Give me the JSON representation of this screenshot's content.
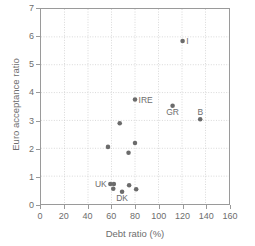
{
  "chart_data": {
    "type": "scatter",
    "title": "",
    "xlabel": "Debt ratio (%)",
    "ylabel": "Euro acceptance ratio",
    "xlim": [
      0,
      160
    ],
    "ylim": [
      0,
      7
    ],
    "xticks": [
      0,
      20,
      40,
      60,
      80,
      100,
      120,
      140,
      160
    ],
    "yticks": [
      0,
      1,
      2,
      3,
      4,
      5,
      6,
      7
    ],
    "grid": true,
    "legend": "none",
    "marker_color": "#6b6b6b",
    "axis_color": "#9a9a9a",
    "text_color": "#6d6d6d",
    "points": [
      {
        "label": "I",
        "x": 120.5,
        "y": 5.85,
        "label_pos": "right"
      },
      {
        "label": "IRE",
        "x": 80.0,
        "y": 3.75,
        "label_pos": "right"
      },
      {
        "label": "GR",
        "x": 112.0,
        "y": 3.53,
        "label_pos": "below"
      },
      {
        "label": "B",
        "x": 135.5,
        "y": 3.04,
        "label_pos": "above"
      },
      {
        "label": "",
        "x": 67.0,
        "y": 2.9,
        "label_pos": "none"
      },
      {
        "label": "",
        "x": 80.0,
        "y": 2.19,
        "label_pos": "none"
      },
      {
        "label": "",
        "x": 57.0,
        "y": 2.05,
        "label_pos": "none"
      },
      {
        "label": "",
        "x": 74.5,
        "y": 1.84,
        "label_pos": "none"
      },
      {
        "label": "UK",
        "x": 59.0,
        "y": 0.72,
        "label_pos": "left"
      },
      {
        "label": "",
        "x": 62.0,
        "y": 0.72,
        "label_pos": "none"
      },
      {
        "label": "",
        "x": 61.5,
        "y": 0.55,
        "label_pos": "none"
      },
      {
        "label": "DK",
        "x": 69.0,
        "y": 0.44,
        "label_pos": "below"
      },
      {
        "label": "",
        "x": 75.0,
        "y": 0.67,
        "label_pos": "none"
      },
      {
        "label": "",
        "x": 81.0,
        "y": 0.53,
        "label_pos": "none"
      }
    ]
  }
}
